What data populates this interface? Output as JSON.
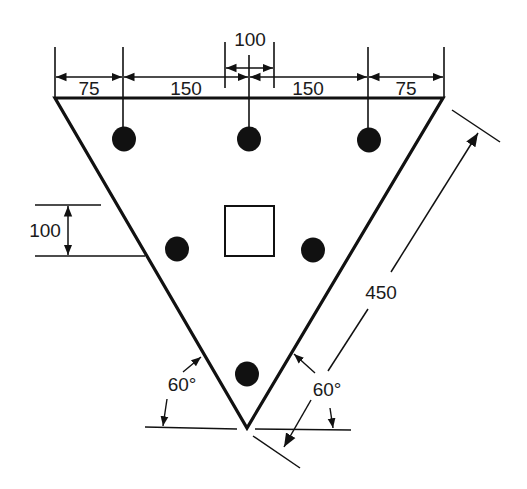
{
  "diagram": {
    "type": "pile-cap-plan",
    "shape": "equilateral-triangle",
    "colors": {
      "line": "#111111",
      "pile": "#111111",
      "background": "#ffffff"
    },
    "top_dimensions": [
      "75",
      "150",
      "150",
      "75"
    ],
    "column_width_dimension": "100",
    "row_spacing_dimension": "100",
    "side_length_dimension": "450",
    "angle_left": "60°",
    "angle_right": "60°",
    "piles_count": 6,
    "column": "square-column"
  }
}
